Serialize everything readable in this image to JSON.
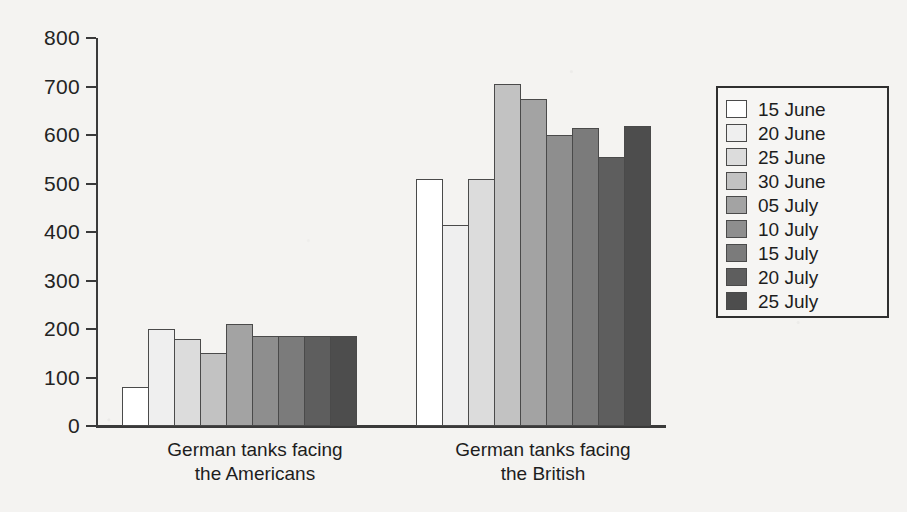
{
  "chart_data": {
    "type": "bar",
    "title": "",
    "subtitle": "",
    "xlabel": "",
    "ylabel": "",
    "ylim": [
      0,
      800
    ],
    "y_ticks": [
      0,
      100,
      200,
      300,
      400,
      500,
      600,
      700,
      800
    ],
    "grid": false,
    "legend_position": "right",
    "categories": [
      "German tanks facing\nthe Americans",
      "German tanks facing\nthe British"
    ],
    "series": [
      {
        "name": "15 June",
        "color": "#ffffff",
        "values": [
          80,
          510
        ]
      },
      {
        "name": "20 June",
        "color": "#efefef",
        "values": [
          200,
          415
        ]
      },
      {
        "name": "25 June",
        "color": "#dcdcdc",
        "values": [
          180,
          510
        ]
      },
      {
        "name": "30 June",
        "color": "#c2c2c2",
        "values": [
          150,
          705
        ]
      },
      {
        "name": "05 July",
        "color": "#a3a3a3",
        "values": [
          210,
          675
        ]
      },
      {
        "name": "10 July",
        "color": "#8e8e8e",
        "values": [
          185,
          600
        ]
      },
      {
        "name": "15 July",
        "color": "#7b7b7b",
        "values": [
          185,
          615
        ]
      },
      {
        "name": "20 July",
        "color": "#5e5e5e",
        "values": [
          185,
          555
        ]
      },
      {
        "name": "25 July",
        "color": "#4d4d4d",
        "values": [
          185,
          618
        ]
      }
    ]
  },
  "axis": {
    "y_tick_labels": [
      "800",
      "700",
      "600",
      "500",
      "400",
      "300",
      "200",
      "100",
      "0"
    ]
  },
  "categories_display": {
    "americans": "German tanks facing\nthe Americans",
    "british": "German tanks facing\nthe British"
  },
  "legend": {
    "items": [
      {
        "label": "15 June"
      },
      {
        "label": "20 June"
      },
      {
        "label": "25 June"
      },
      {
        "label": "30 June"
      },
      {
        "label": "05 July"
      },
      {
        "label": "10 July"
      },
      {
        "label": "15 July"
      },
      {
        "label": "20 July"
      },
      {
        "label": "25 July"
      }
    ]
  }
}
